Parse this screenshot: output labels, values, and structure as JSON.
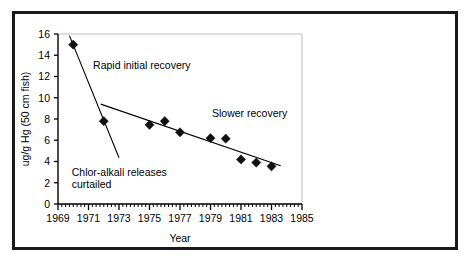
{
  "chart_data": {
    "type": "scatter",
    "title": "",
    "xlabel": "Year",
    "ylabel": "ug/g Hg (50 cm fish)",
    "xlim": [
      1969,
      1985
    ],
    "ylim": [
      0,
      16
    ],
    "grid": false,
    "legend_position": "none",
    "x_major_ticks": [
      1969,
      1971,
      1973,
      1975,
      1977,
      1979,
      1981,
      1983,
      1985
    ],
    "x_tick_labels": [
      "1969",
      "1971",
      "1973",
      "1975",
      "1977",
      "1979",
      "1981",
      "1983",
      "1985"
    ],
    "x_minor_tick_step": 0.25,
    "y_major_ticks": [
      0,
      2,
      4,
      6,
      8,
      10,
      12,
      14,
      16
    ],
    "y_tick_labels": [
      "0",
      "2",
      "4",
      "6",
      "8",
      "10",
      "12",
      "14",
      "16"
    ],
    "marker_shape": "diamond",
    "marker_color": "#111111",
    "points": [
      {
        "x": 1970,
        "y": 15.0
      },
      {
        "x": 1972,
        "y": 7.8
      },
      {
        "x": 1975,
        "y": 7.45
      },
      {
        "x": 1976,
        "y": 7.8
      },
      {
        "x": 1977,
        "y": 6.75
      },
      {
        "x": 1979,
        "y": 6.2
      },
      {
        "x": 1980,
        "y": 6.15
      },
      {
        "x": 1981,
        "y": 4.2
      },
      {
        "x": 1982,
        "y": 3.9
      },
      {
        "x": 1983,
        "y": 3.55
      }
    ],
    "trend_lines": [
      {
        "name": "rapid-initial-recovery-trend",
        "x": [
          1969.75,
          1973.0
        ],
        "y": [
          15.85,
          4.35
        ]
      },
      {
        "name": "slower-recovery-trend",
        "x": [
          1971.8,
          1983.6
        ],
        "y": [
          9.4,
          3.6
        ]
      }
    ],
    "annotations": [
      {
        "name": "rapid-initial-recovery",
        "text": "Rapid initial recovery",
        "x": 1971.3,
        "y": 13.05
      },
      {
        "name": "slower-recovery",
        "text": "Slower recovery",
        "x": 1979.1,
        "y": 8.5
      },
      {
        "name": "chlor-alkali-line-1",
        "text": "Chlor-alkali releases",
        "x": 1969.9,
        "y": 3.0
      },
      {
        "name": "chlor-alkali-line-2",
        "text": "curtailed",
        "x": 1969.9,
        "y": 1.85
      }
    ]
  },
  "axis": {
    "x_title": "Year",
    "y_title": "ug/g Hg (50 cm fish)"
  }
}
